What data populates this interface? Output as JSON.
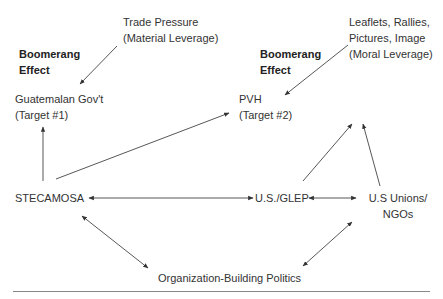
{
  "diagram": {
    "type": "network-flow",
    "nodes": {
      "trade_pressure": {
        "line1": "Trade Pressure",
        "line2": "(Material Leverage)"
      },
      "boomerang_left": {
        "line1": "Boomerang",
        "line2": "Effect"
      },
      "guatemalan_gov": {
        "line1": "Guatemalan Gov't",
        "line2": "(Target #1)"
      },
      "moral_leverage": {
        "line1": "Leaflets, Rallies,",
        "line2": "Pictures, Image",
        "line3": "(Moral Leverage)"
      },
      "boomerang_right": {
        "line1": "Boomerang",
        "line2": "Effect"
      },
      "pvh": {
        "line1": "PVH",
        "line2": "(Target #2)"
      },
      "stecamosa": {
        "label": "STECAMOSA"
      },
      "us_glep": {
        "label": "U.S./GLEP"
      },
      "us_unions": {
        "line1": "U.S Unions/",
        "line2": "NGOs"
      },
      "org_building": {
        "label": "Organization-Building Politics"
      }
    },
    "edges": [
      {
        "from": "Trade Pressure",
        "to": "Guatemalan Gov't",
        "direction": "one-way"
      },
      {
        "from": "Leaflets, Rallies, Pictures, Image",
        "to": "PVH",
        "direction": "one-way"
      },
      {
        "from": "STECAMOSA",
        "to": "Guatemalan Gov't",
        "direction": "one-way"
      },
      {
        "from": "STECAMOSA",
        "to": "PVH",
        "direction": "one-way"
      },
      {
        "from": "U.S./GLEP",
        "to": "STECAMOSA",
        "direction": "two-way"
      },
      {
        "from": "U.S./GLEP",
        "to": "U.S Unions/NGOs",
        "direction": "two-way"
      },
      {
        "from": "U.S./GLEP",
        "to": "Leaflets, Rallies, Pictures, Image",
        "direction": "one-way"
      },
      {
        "from": "U.S Unions/NGOs",
        "to": "Leaflets, Rallies, Pictures, Image",
        "direction": "one-way"
      },
      {
        "from": "STECAMOSA",
        "to": "Organization-Building Politics",
        "direction": "two-way"
      },
      {
        "from": "U.S Unions/NGOs",
        "to": "Organization-Building Politics",
        "direction": "two-way"
      }
    ],
    "colors": {
      "text": "#333333",
      "line": "#444444",
      "rule": "#888888",
      "background": "#ffffff"
    }
  }
}
